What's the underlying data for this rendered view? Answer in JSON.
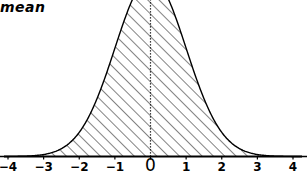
{
  "annotations": {
    "mean_label": "mean"
  },
  "axis": {
    "tick_labels": [
      "−4",
      "−3",
      "−2",
      "−1",
      "0",
      "1",
      "2",
      "3",
      "4"
    ],
    "tick_values": [
      -4,
      -3,
      -2,
      -1,
      0,
      1,
      2,
      3,
      4
    ]
  },
  "style": {
    "curve_color": "#000000",
    "axis_color": "#000000",
    "hatch_color": "#1a1a1a",
    "background": "#ffffff",
    "mean_line_color": "#000000"
  },
  "chart_data": {
    "type": "area",
    "title": "",
    "subtitle": "",
    "xlabel": "",
    "ylabel": "",
    "xlim": [
      -4.4,
      4.4
    ],
    "ylim": [
      0,
      1.22
    ],
    "grid": false,
    "legend": null,
    "distribution": "normal",
    "mean": 0,
    "std_dev": 1,
    "fill": "diagonal-hatch",
    "hatch_angle_deg": 45,
    "hatch_spacing_px": 8,
    "mean_line_style": "dotted",
    "peak_clipped_at_top": true,
    "x": [
      -4.0,
      -3.75,
      -3.5,
      -3.25,
      -3.0,
      -2.75,
      -2.5,
      -2.25,
      -2.0,
      -1.75,
      -1.5,
      -1.25,
      -1.0,
      -0.75,
      -0.5,
      -0.25,
      0.0,
      0.25,
      0.5,
      0.75,
      1.0,
      1.25,
      1.5,
      1.75,
      2.0,
      2.25,
      2.5,
      2.75,
      3.0,
      3.25,
      3.5,
      3.75,
      4.0
    ],
    "y": [
      0.0001,
      0.0004,
      0.0009,
      0.002,
      0.0044,
      0.0091,
      0.0175,
      0.0317,
      0.054,
      0.0863,
      0.1295,
      0.1826,
      0.242,
      0.3011,
      0.3521,
      0.3867,
      0.3989,
      0.3867,
      0.3521,
      0.3011,
      0.242,
      0.1826,
      0.1295,
      0.0863,
      0.054,
      0.0317,
      0.0175,
      0.0091,
      0.0044,
      0.002,
      0.0009,
      0.0004,
      0.0001
    ],
    "annotations": [
      {
        "text": "mean",
        "x": -4.3,
        "y": 1.18,
        "style": "bold-italic"
      }
    ],
    "xticks": [
      -4,
      -3,
      -2,
      -1,
      0,
      1,
      2,
      3,
      4
    ],
    "xticklabels": [
      "−4",
      "−3",
      "−2",
      "−1",
      "0",
      "1",
      "2",
      "3",
      "4"
    ]
  }
}
